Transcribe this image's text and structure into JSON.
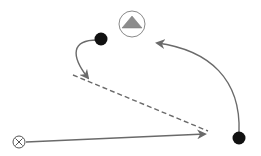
{
  "diagram": {
    "type": "play-diagram",
    "colors": {
      "line": "#6a6a6a",
      "dot": "#111111",
      "triangle": "#8c8c8c",
      "circle_stroke": "#8a8a8a",
      "background": "#ffffff"
    },
    "markers": [
      {
        "id": "triangle-marker",
        "icon": "triangle-in-circle-icon",
        "x": 132,
        "y": 24
      },
      {
        "id": "dot-top",
        "icon": "filled-circle-icon",
        "x": 101,
        "y": 39
      },
      {
        "id": "dot-bottom-right",
        "icon": "filled-circle-icon",
        "x": 239,
        "y": 138
      },
      {
        "id": "x-marker",
        "icon": "circled-x-icon",
        "x": 19,
        "y": 142
      }
    ],
    "paths": [
      {
        "id": "curve-from-dot-top",
        "style": "solid",
        "arrow": true
      },
      {
        "id": "dashed-diagonal",
        "style": "dashed",
        "arrow": false
      },
      {
        "id": "line-from-x",
        "style": "solid",
        "arrow": true
      },
      {
        "id": "arc-from-dot-bottom-right",
        "style": "solid",
        "arrow": true
      }
    ]
  }
}
